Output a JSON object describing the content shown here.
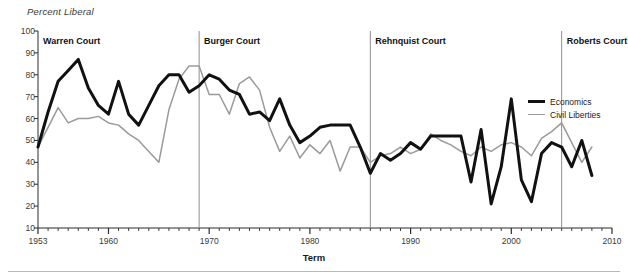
{
  "chart_data": {
    "type": "line",
    "title": "",
    "xlabel": "Term",
    "ylabel": "Percent Liberal",
    "xlim": [
      1953,
      2010
    ],
    "ylim": [
      10,
      100
    ],
    "grid": false,
    "legend_position": "right",
    "xticks": [
      1953,
      1960,
      1970,
      1980,
      1990,
      2000,
      2010
    ],
    "xtick_labels": [
      "1953",
      "1960",
      "1970",
      "1980",
      "1990",
      "2000",
      "2010"
    ],
    "yticks": [
      10,
      20,
      30,
      40,
      50,
      60,
      70,
      80,
      90,
      100
    ],
    "ytick_labels": [
      "10",
      "20",
      "30",
      "40",
      "50",
      "60",
      "70",
      "80",
      "90",
      "100"
    ],
    "x": [
      1953,
      1954,
      1955,
      1956,
      1957,
      1958,
      1959,
      1960,
      1961,
      1962,
      1963,
      1964,
      1965,
      1966,
      1967,
      1968,
      1969,
      1970,
      1971,
      1972,
      1973,
      1974,
      1975,
      1976,
      1977,
      1978,
      1979,
      1980,
      1981,
      1982,
      1983,
      1984,
      1985,
      1986,
      1987,
      1988,
      1989,
      1990,
      1991,
      1992,
      1993,
      1994,
      1995,
      1996,
      1997,
      1998,
      1999,
      2000,
      2001,
      2002,
      2003,
      2004,
      2005,
      2006,
      2007,
      2008
    ],
    "series": [
      {
        "name": "Economics",
        "color": "#111111",
        "linewidth": 3,
        "values": [
          47,
          63,
          77,
          82,
          87,
          74,
          66,
          62,
          77,
          62,
          57,
          66,
          75,
          80,
          80,
          72,
          75,
          80,
          78,
          73,
          71,
          62,
          63,
          59,
          69,
          57,
          49,
          52,
          56,
          57,
          57,
          57,
          47,
          35,
          44,
          41,
          44,
          49,
          46,
          52,
          52,
          52,
          52,
          31,
          55,
          21,
          38,
          69,
          32,
          22,
          44,
          49,
          47,
          38,
          50,
          34
        ]
      },
      {
        "name": "Civil Liberties",
        "color": "#9a9a9a",
        "linewidth": 1.5,
        "values": [
          47,
          56,
          65,
          58,
          60,
          60,
          61,
          58,
          57,
          53,
          50,
          45,
          40,
          64,
          78,
          84,
          84,
          71,
          71,
          62,
          76,
          79,
          73,
          56,
          45,
          52,
          42,
          48,
          44,
          50,
          36,
          47,
          47,
          40,
          43,
          44,
          47,
          44,
          46,
          53,
          50,
          48,
          45,
          43,
          47,
          45,
          48,
          49,
          47,
          43,
          51,
          54,
          58,
          49,
          40,
          47
        ]
      }
    ],
    "annotations": [
      {
        "label": "Warren Court",
        "start_year": 1953,
        "divider_year": null
      },
      {
        "label": "Burger Court",
        "start_year": 1969,
        "divider_year": 1969
      },
      {
        "label": "Rehnquist Court",
        "start_year": 1986,
        "divider_year": 1986
      },
      {
        "label": "Roberts Court",
        "start_year": 2005,
        "divider_year": 2005
      }
    ]
  },
  "legend": {
    "items": [
      {
        "label": "Economics"
      },
      {
        "label": "Civil Liberties"
      }
    ]
  }
}
